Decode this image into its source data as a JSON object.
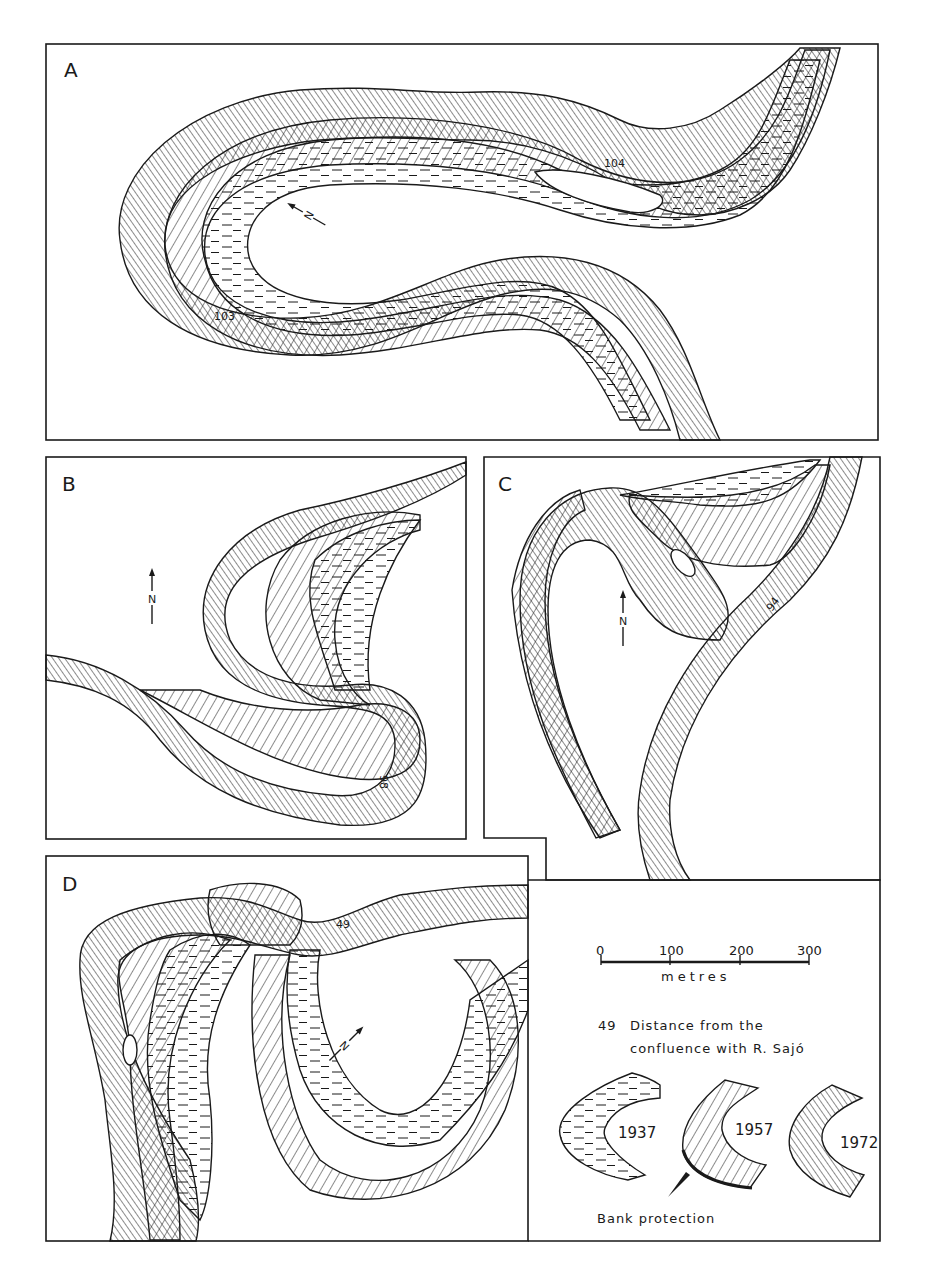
{
  "figure": {
    "type": "river channel change maps",
    "colors": {
      "ink": "#1a1a1a",
      "paper": "#ffffff"
    }
  },
  "panels": [
    {
      "id": "A",
      "letter": "A",
      "north": "N",
      "km_labels": [
        "104",
        "103"
      ]
    },
    {
      "id": "B",
      "letter": "B",
      "north": "N",
      "km_labels": [
        "98"
      ]
    },
    {
      "id": "C",
      "letter": "C",
      "north": "N",
      "km_labels": [
        "94"
      ]
    },
    {
      "id": "D",
      "letter": "D",
      "north": "N",
      "km_labels": [
        "49"
      ]
    }
  ],
  "legend": {
    "scale": {
      "ticks": [
        "0",
        "100",
        "200",
        "300"
      ],
      "unit": "metres"
    },
    "distance_note": {
      "number": "49",
      "line1": "Distance from the",
      "line2": "confluence with R. Sajó"
    },
    "years": [
      {
        "year": "1937",
        "pattern": "dashes"
      },
      {
        "year": "1957",
        "pattern": "wide diagonal hatch"
      },
      {
        "year": "1972",
        "pattern": "dense back-diagonal hatch"
      }
    ],
    "bank_protection": "Bank protection"
  }
}
